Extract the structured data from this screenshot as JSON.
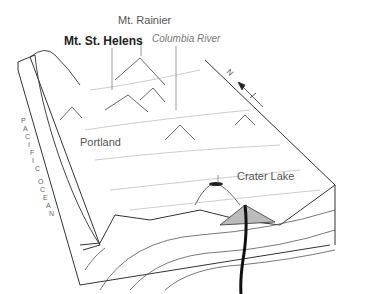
{
  "labels": {
    "mt_rainier": "Mt. Rainier",
    "mt_st_helens": "Mt. St. Helens",
    "columbia_river": "Columbia River",
    "portland": "Portland",
    "crater_lake": "Crater Lake",
    "pacific_ocean": [
      "P",
      "A",
      "C",
      "I",
      "F",
      "I",
      "C",
      "O",
      "C",
      "E",
      "A",
      "N"
    ],
    "compass": "N"
  },
  "colors": {
    "line": "#333333",
    "terrain": "#999999",
    "magma": "#111111"
  }
}
